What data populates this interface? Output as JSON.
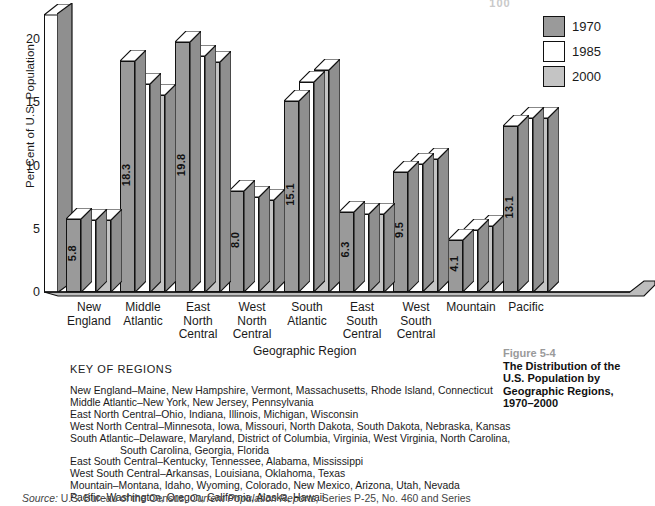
{
  "top_artifact": "100",
  "chart_data": {
    "type": "bar",
    "title": "",
    "xlabel": "Geographic Region",
    "ylabel": "Per Cent of U.S. Population",
    "ylim": [
      0,
      22
    ],
    "yticks": [
      0,
      5,
      10,
      15,
      20
    ],
    "grid": false,
    "legend_position": "top-right",
    "categories": [
      "New\nEngland",
      "Middle\nAtlantic",
      "East\nNorth\nCentral",
      "West\nNorth\nCentral",
      "South\nAtlantic",
      "East\nSouth\nCentral",
      "West\nSouth\nCentral",
      "Mountain",
      "Pacific"
    ],
    "series": [
      {
        "name": "1970",
        "color": "#9a9a9a",
        "values": [
          5.8,
          18.3,
          19.8,
          8.0,
          15.1,
          6.3,
          9.5,
          4.1,
          13.1
        ]
      },
      {
        "name": "1985",
        "color": "#ffffff",
        "values": [
          5.7,
          16.5,
          18.7,
          7.5,
          16.6,
          6.2,
          10.1,
          4.9,
          13.8
        ]
      },
      {
        "name": "2000",
        "color": "#c4c4c4",
        "values": [
          5.7,
          15.6,
          18.2,
          7.3,
          17.6,
          6.2,
          10.5,
          5.2,
          13.8
        ]
      }
    ]
  },
  "legend": {
    "items": [
      {
        "label": "1970",
        "color": "#9a9a9a"
      },
      {
        "label": "1985",
        "color": "#ffffff"
      },
      {
        "label": "2000",
        "color": "#c4c4c4"
      }
    ]
  },
  "key": {
    "title": "KEY OF REGIONS",
    "lines": [
      "New England–Maine, New Hampshire, Vermont, Massachusetts, Rhode Island, Connecticut",
      "Middle Atlantic–New York, New Jersey, Pennsylvania",
      "East North Central–Ohio, Indiana, Illinois, Michigan, Wisconsin",
      "West North Central–Minnesota, Iowa, Missouri, North Dakota, South Dakota, Nebraska, Kansas",
      "South Atlantic–Delaware, Maryland, District of Columbia, Virginia, West Virginia, North Carolina,",
      "South Carolina, Georgia, Florida",
      "East South Central–Kentucky, Tennessee, Alabama, Mississippi",
      "West South Central–Arkansas, Louisiana, Oklahoma, Texas",
      "Mountain–Montana, Idaho, Wyoming, Colorado, New Mexico, Arizona, Utah, Nevada",
      "Pacific–Washington, Oregon, California, Alaska, Hawaii"
    ],
    "indented_line_index": 5
  },
  "figure": {
    "number": "Figure 5-4",
    "title_line1": "The Distribution of the",
    "title_line2": "U.S. Population by",
    "title_line3": "Geographic Regions,",
    "title_line4": "1970–2000"
  },
  "source": {
    "prefix": "Source:",
    "text_a": " U.S. Bureau of the Census, ",
    "italic": "Current Population Reports,",
    "text_b": " Series P-25, No. 460 and Series"
  },
  "colors": {
    "series_1970": "#9a9a9a",
    "series_1985": "#ffffff",
    "series_2000": "#c4c4c4",
    "axis": "#111111",
    "fig_num": "#9a9a9a"
  }
}
